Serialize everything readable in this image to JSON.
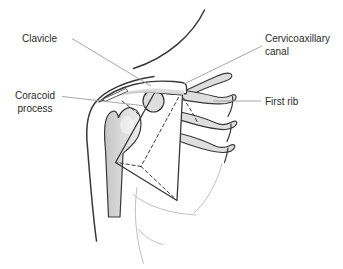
{
  "figure_labels": {
    "clavicle": "Clavicle",
    "coracoid": {
      "line1": "Coracoid",
      "line2": "process"
    },
    "cervicoaxillary": {
      "line1": "Cervicoaxillary",
      "line2": "canal"
    },
    "first_rib": "First rib"
  },
  "structures": [
    "clavicle",
    "coracoid-process",
    "cervicoaxillary-canal-wedge",
    "first-rib",
    "second-rib",
    "third-rib",
    "humerus",
    "neck-outline",
    "shoulder-arm-outline",
    "chest-wall-contours"
  ],
  "colors": {
    "background": "#ffffff",
    "outline": "#383838",
    "bone_fill": "#dedede",
    "leader_line": "#9c9c9c",
    "light_contour": "#c0c0c0",
    "label_text": "#2a2a2a"
  }
}
